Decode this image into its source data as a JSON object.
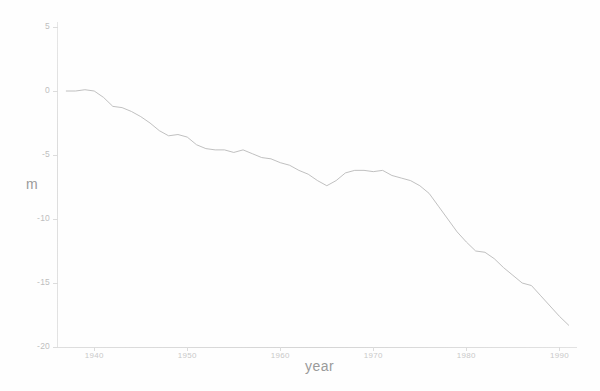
{
  "chart_data": {
    "type": "line",
    "title": "",
    "xlabel": "year",
    "ylabel": "m",
    "xlim": [
      1936,
      1992
    ],
    "ylim": [
      -20,
      5
    ],
    "grid": false,
    "legend": null,
    "xticks": [
      1940,
      1950,
      1960,
      1970,
      1980,
      1990
    ],
    "xtick_labels": [
      "1940",
      "1950",
      "1960",
      "1970",
      "1980",
      "1990"
    ],
    "yticks": [
      5,
      0,
      -5,
      -10,
      -15,
      -20
    ],
    "ytick_labels": [
      "5",
      "0",
      "-5",
      "-10",
      "-15",
      "-20"
    ],
    "series": [
      {
        "name": "cumulative mass balance",
        "x": [
          1937,
          1938,
          1939,
          1940,
          1941,
          1942,
          1943,
          1944,
          1945,
          1946,
          1947,
          1948,
          1949,
          1950,
          1951,
          1952,
          1953,
          1954,
          1955,
          1956,
          1957,
          1958,
          1959,
          1960,
          1961,
          1962,
          1963,
          1964,
          1965,
          1966,
          1967,
          1968,
          1969,
          1970,
          1971,
          1972,
          1973,
          1974,
          1975,
          1976,
          1977,
          1978,
          1979,
          1980,
          1981,
          1982,
          1983,
          1984,
          1985,
          1986,
          1987,
          1988,
          1989,
          1990,
          1991
        ],
        "values": [
          0.0,
          0.0,
          0.1,
          0.0,
          -0.5,
          -1.2,
          -1.3,
          -1.6,
          -2.0,
          -2.5,
          -3.1,
          -3.5,
          -3.4,
          -3.6,
          -4.2,
          -4.5,
          -4.6,
          -4.6,
          -4.8,
          -4.6,
          -4.9,
          -5.2,
          -5.3,
          -5.6,
          -5.8,
          -6.2,
          -6.5,
          -7.0,
          -7.4,
          -7.0,
          -6.4,
          -6.2,
          -6.2,
          -6.3,
          -6.2,
          -6.6,
          -6.8,
          -7.0,
          -7.4,
          -8.0,
          -9.0,
          -10.0,
          -11.0,
          -11.8,
          -12.5,
          -12.6,
          -13.1,
          -13.8,
          -14.4,
          -15.0,
          -15.2,
          -16.0,
          -16.8,
          -17.6,
          -18.3
        ]
      }
    ]
  },
  "axis": {
    "y_title": "m",
    "x_title": "year"
  }
}
